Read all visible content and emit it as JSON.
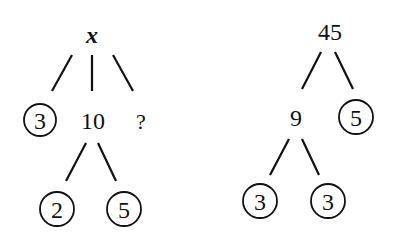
{
  "trees": [
    {
      "name": "left-factor-tree",
      "root": {
        "label": "x"
      },
      "level1": [
        {
          "label": "3",
          "circled": true
        },
        {
          "label": "10",
          "circled": false
        },
        {
          "label": "?",
          "circled": false
        }
      ],
      "level2": [
        {
          "label": "2",
          "circled": true
        },
        {
          "label": "5",
          "circled": true
        }
      ]
    },
    {
      "name": "right-factor-tree",
      "root": {
        "label": "45"
      },
      "level1": [
        {
          "label": "9",
          "circled": false
        },
        {
          "label": "5",
          "circled": true
        }
      ],
      "level2": [
        {
          "label": "3",
          "circled": true
        },
        {
          "label": "3",
          "circled": true
        }
      ]
    }
  ]
}
